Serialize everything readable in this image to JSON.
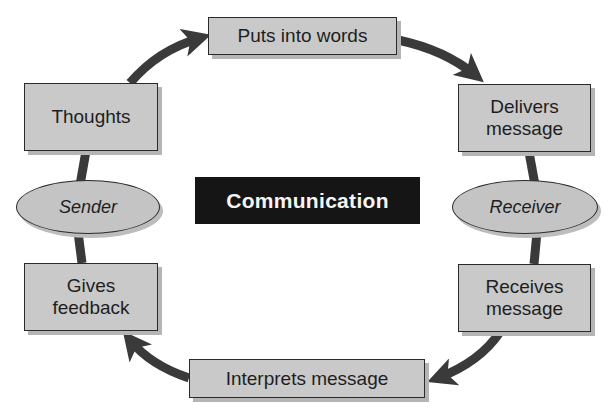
{
  "diagram": {
    "title": "Communication",
    "colors": {
      "box_fill": "#c9c9c9",
      "ellipse_fill": "#c4c4c4",
      "arrow": "#3a3a3a",
      "title_bg": "#151515",
      "title_text": "#f5f5f5"
    },
    "roles": {
      "sender": "Sender",
      "receiver": "Receiver"
    },
    "steps": [
      {
        "id": "thoughts",
        "label": "Thoughts"
      },
      {
        "id": "puts-into-words",
        "label": "Puts into words"
      },
      {
        "id": "delivers-message",
        "line1": "Delivers",
        "line2": "message"
      },
      {
        "id": "receives-message",
        "line1": "Receives",
        "line2": "message"
      },
      {
        "id": "interprets-message",
        "label": "Interprets message"
      },
      {
        "id": "gives-feedback",
        "line1": "Gives",
        "line2": "feedback"
      }
    ],
    "flow": [
      "Thoughts -> Puts into words",
      "Puts into words -> Delivers message",
      "Delivers message -> Receiver",
      "Receiver -> Receives message",
      "Receives message -> Interprets message",
      "Interprets message -> Gives feedback",
      "Gives feedback -> Sender",
      "Sender -> Thoughts"
    ]
  }
}
